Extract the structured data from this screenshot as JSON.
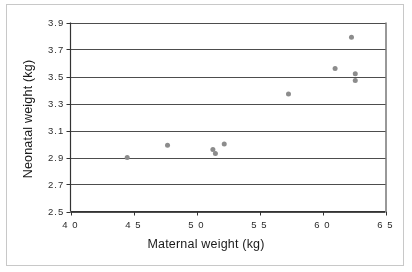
{
  "chart_data": {
    "type": "scatter",
    "title": "",
    "xlabel": "Maternal weight (kg)",
    "ylabel": "Neonatal weight (kg)",
    "xlim": [
      40,
      65
    ],
    "ylim": [
      2.5,
      3.9
    ],
    "xticks": [
      "4 0",
      "4 5",
      "5 0",
      "5 5",
      "6 0",
      "6 5"
    ],
    "xtick_values": [
      40,
      45,
      50,
      55,
      60,
      65
    ],
    "yticks": [
      "2.5",
      "2.7",
      "2.9",
      "3.1",
      "3.3",
      "3.5",
      "3.7",
      "3.9"
    ],
    "ytick_values": [
      2.5,
      2.7,
      2.9,
      3.1,
      3.3,
      3.5,
      3.7,
      3.9
    ],
    "grid": "horizontal",
    "legend": "none",
    "marker": {
      "shape": "circle",
      "color": "#8c8c8c",
      "size": 5
    },
    "series": [
      {
        "name": "observations",
        "points": [
          {
            "x": 44.5,
            "y": 2.9
          },
          {
            "x": 47.7,
            "y": 2.99
          },
          {
            "x": 51.3,
            "y": 2.96
          },
          {
            "x": 51.5,
            "y": 2.93
          },
          {
            "x": 52.2,
            "y": 3.0
          },
          {
            "x": 57.3,
            "y": 3.37
          },
          {
            "x": 61.0,
            "y": 3.56
          },
          {
            "x": 62.3,
            "y": 3.79
          },
          {
            "x": 62.6,
            "y": 3.52
          },
          {
            "x": 62.6,
            "y": 3.47
          }
        ]
      }
    ]
  },
  "style": {
    "axis_color": "#333333",
    "grid_color": "#4d4d4d",
    "border_color": "#c8c8c8",
    "text_color": "#1a1a1a"
  }
}
